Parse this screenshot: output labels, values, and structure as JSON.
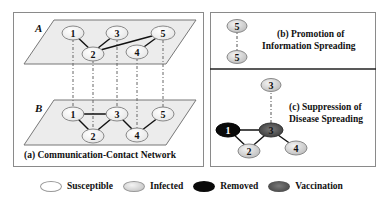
{
  "figure": {
    "panel_a": {
      "caption": "(a) Communication-Contact Network",
      "layer_a_label": "A",
      "layer_b_label": "B",
      "layer_a_nodes": [
        "1",
        "2",
        "3",
        "4",
        "5"
      ],
      "layer_a_edges": [
        [
          "1",
          "2"
        ],
        [
          "2",
          "3"
        ],
        [
          "2",
          "5"
        ],
        [
          "4",
          "5"
        ]
      ],
      "layer_b_nodes": [
        "1",
        "2",
        "3",
        "4",
        "5"
      ],
      "layer_b_edges": [
        [
          "1",
          "3"
        ],
        [
          "1",
          "2"
        ],
        [
          "2",
          "3"
        ],
        [
          "3",
          "4"
        ],
        [
          "4",
          "5"
        ]
      ]
    },
    "panel_b": {
      "caption_line1": "(b) Promotion of",
      "caption_line2": "Information Spreading",
      "top_node": "5",
      "bottom_node": "5"
    },
    "panel_c": {
      "caption_line1": "(c) Suppression of",
      "caption_line2": "Disease Spreading",
      "nodes": {
        "n3_top": "3",
        "n1": "1",
        "n3": "3",
        "n2": "2",
        "n4": "4"
      }
    }
  },
  "legend": {
    "items": [
      {
        "label": "Susceptible",
        "state": "susceptible"
      },
      {
        "label": "Infected",
        "state": "infected"
      },
      {
        "label": "Removed",
        "state": "removed"
      },
      {
        "label": "Vaccination",
        "state": "vaccination"
      }
    ]
  },
  "colors": {
    "susceptible": "#ffffff",
    "infected": "#d8d8d8",
    "removed": "#0a0a0a",
    "vaccination": "#555555",
    "plane": "#ececec",
    "border": "#8a8a8a"
  }
}
